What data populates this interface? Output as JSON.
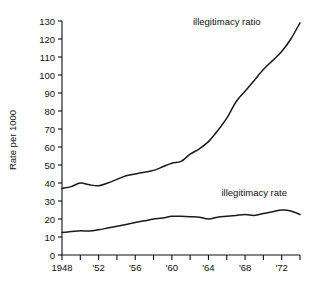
{
  "chart_data": {
    "type": "line",
    "title": "",
    "xlabel": "",
    "ylabel": "Rate per 1000",
    "xlim": [
      1948,
      1974
    ],
    "ylim": [
      0,
      130
    ],
    "grid": false,
    "legend_position": "inline-right",
    "y_ticks": [
      0,
      10,
      20,
      30,
      40,
      50,
      60,
      70,
      80,
      90,
      100,
      110,
      120,
      130
    ],
    "y_tick_labels": [
      "0",
      "10",
      "20",
      "30",
      "40",
      "50",
      "60",
      "70",
      "80",
      "90",
      "100",
      "110",
      "120",
      "130"
    ],
    "x_ticks": [
      1948,
      1950,
      1952,
      1954,
      1956,
      1958,
      1960,
      1962,
      1964,
      1966,
      1968,
      1970,
      1972,
      1974
    ],
    "x_tick_labels": [
      "1948",
      "",
      "'52",
      "",
      "'56",
      "",
      "'60",
      "",
      "'64",
      "",
      "'68",
      "",
      "'72",
      ""
    ],
    "x": [
      1948,
      1949,
      1950,
      1951,
      1952,
      1953,
      1954,
      1955,
      1956,
      1957,
      1958,
      1959,
      1960,
      1961,
      1962,
      1963,
      1964,
      1965,
      1966,
      1967,
      1968,
      1969,
      1970,
      1971,
      1972,
      1973,
      1974
    ],
    "series": [
      {
        "name": "illegitimacy ratio",
        "label": "illegitimacy ratio",
        "values": [
          37,
          38,
          40,
          39,
          38.5,
          40,
          42,
          44,
          45,
          46,
          47,
          49,
          51,
          52,
          56,
          59,
          63,
          69,
          76,
          85,
          91,
          97,
          103,
          108,
          113,
          120,
          129
        ]
      },
      {
        "name": "illegitimacy rate",
        "label": "illegitimacy rate",
        "values": [
          12.5,
          13,
          13.5,
          13.3,
          14,
          15,
          16,
          17,
          18,
          19,
          20,
          20.5,
          21.5,
          21.5,
          21.3,
          21,
          20,
          21,
          21.5,
          22,
          22.5,
          22,
          23,
          24,
          25,
          24.5,
          22.5
        ]
      }
    ],
    "annotations": [
      {
        "text": "illegitimacy ratio",
        "x": 1966,
        "y": 128
      },
      {
        "text": "illegitimacy rate",
        "x": 1969,
        "y": 33
      }
    ]
  }
}
